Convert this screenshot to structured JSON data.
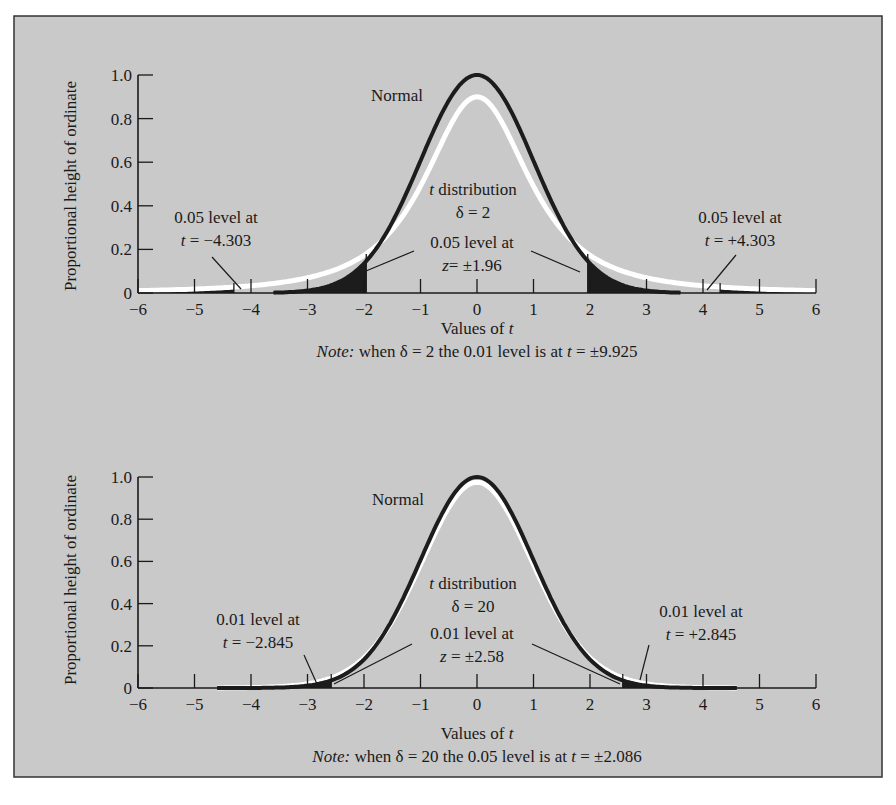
{
  "colors": {
    "page_bg": "#ffffff",
    "panel_bg": "#c9c9c9",
    "frame": "#333333",
    "normal_curve": "#1c1c1c",
    "t_curve": "#ffffff",
    "axis": "#1a1a1a",
    "tail_fill": "#1c1c1c"
  },
  "chart_data": [
    {
      "type": "line",
      "title": "",
      "xlabel": "Values of t",
      "ylabel": "Proportional height of ordinate",
      "xlim": [
        -6,
        6
      ],
      "ylim": [
        0,
        1.0
      ],
      "x_ticks": [
        -6,
        -5,
        -4,
        -3,
        -2,
        -1,
        0,
        1,
        2,
        3,
        4,
        5,
        6
      ],
      "x_tick_labels": [
        "−6",
        "−5",
        "−4",
        "−3",
        "−2",
        "−1",
        "0",
        "1",
        "2",
        "3",
        "4",
        "5",
        "6"
      ],
      "y_ticks": [
        0,
        0.2,
        0.4,
        0.6,
        0.8,
        1.0
      ],
      "y_tick_labels": [
        "0",
        "0.2",
        "0.4",
        "0.6",
        "0.8",
        "1.0"
      ],
      "grid": false,
      "series": [
        {
          "name": "Normal",
          "kind": "normal",
          "peak": 1.0,
          "color": "#1c1c1c"
        },
        {
          "name": "t distribution δ = 2",
          "kind": "t",
          "df": 2,
          "peak": 0.9,
          "color": "#ffffff"
        }
      ],
      "shaded_tails": {
        "normal": [
          -3.6,
          -1.96,
          1.96,
          3.6
        ],
        "t": [
          -6,
          -4.303,
          4.303,
          6
        ]
      },
      "critical_lines": [
        -4.303,
        -1.96,
        1.96,
        4.303
      ],
      "annotations": {
        "normal": "Normal",
        "t_line1": "t distribution",
        "t_line2": "δ = 2",
        "left_line1": "0.05 level at",
        "left_line2": "t = −4.303",
        "center_line1": "0.05 level at",
        "center_line2": "z= ±1.96",
        "right_line1": "0.05 level at",
        "right_line2": "t = +4.303"
      },
      "note_prefix": "Note:",
      "note_text": " when δ = 2 the 0.01 level is at t = ±9.925"
    },
    {
      "type": "line",
      "title": "",
      "xlabel": "Values of t",
      "ylabel": "Proportional height of ordinate",
      "xlim": [
        -6,
        6
      ],
      "ylim": [
        0,
        1.0
      ],
      "x_ticks": [
        -6,
        -5,
        -4,
        -3,
        -2,
        -1,
        0,
        1,
        2,
        3,
        4,
        5,
        6
      ],
      "x_tick_labels": [
        "−6",
        "−5",
        "−4",
        "−3",
        "−2",
        "−1",
        "0",
        "1",
        "2",
        "3",
        "4",
        "5",
        "6"
      ],
      "y_ticks": [
        0,
        0.2,
        0.4,
        0.6,
        0.8,
        1.0
      ],
      "y_tick_labels": [
        "0",
        "0.2",
        "0.4",
        "0.6",
        "0.8",
        "1.0"
      ],
      "grid": false,
      "series": [
        {
          "name": "Normal",
          "kind": "normal",
          "peak": 1.0,
          "color": "#1c1c1c"
        },
        {
          "name": "t distribution δ = 20",
          "kind": "t",
          "df": 20,
          "peak": 0.975,
          "color": "#ffffff"
        }
      ],
      "shaded_tails": {
        "normal": [
          -4.6,
          -2.58,
          2.58,
          4.6
        ],
        "t": [
          -4.6,
          -2.845,
          2.845,
          4.6
        ]
      },
      "critical_lines": [
        -2.58,
        2.58
      ],
      "annotations": {
        "normal": "Normal",
        "t_line1": "t distribution",
        "t_line2": "δ = 20",
        "left_line1": "0.01 level at",
        "left_line2": "t = −2.845",
        "center_line1": "0.01 level at",
        "center_line2": "z = ±2.58",
        "right_line1": "0.01 level at",
        "right_line2": "t = +2.845"
      },
      "note_prefix": "Note:",
      "note_text": " when δ = 20 the 0.05 level is at t = ±2.086"
    }
  ]
}
